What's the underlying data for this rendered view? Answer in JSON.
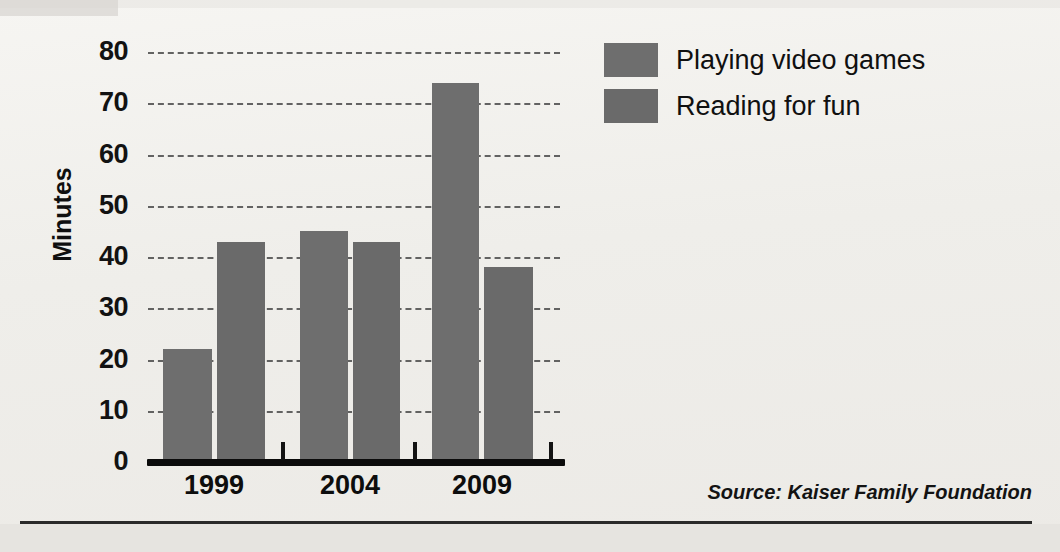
{
  "chart_data": {
    "type": "bar",
    "title": "",
    "subtitle": "",
    "xlabel": "",
    "ylabel": "Minutes",
    "categories": [
      "1999",
      "2004",
      "2009"
    ],
    "series": [
      {
        "name": "Playing video games",
        "values": [
          22,
          45,
          74
        ],
        "color": "#6e6e6e"
      },
      {
        "name": "Reading for fun",
        "values": [
          43,
          43,
          38
        ],
        "color": "#6a6a6a"
      }
    ],
    "ylim": [
      0,
      80
    ],
    "ytick_labels": [
      "0",
      "10",
      "20",
      "30",
      "40",
      "50",
      "60",
      "70",
      "80"
    ],
    "ytick_values": [
      0,
      10,
      20,
      30,
      40,
      50,
      60,
      70,
      80
    ],
    "grid": "horizontal-dashed",
    "legend_position": "top-right",
    "annotations": [
      "Source: Kaiser Family Foundation"
    ]
  },
  "axis": {
    "y_title": "Minutes",
    "ticks": [
      {
        "label": "80",
        "value": 80
      },
      {
        "label": "70",
        "value": 70
      },
      {
        "label": "60",
        "value": 60
      },
      {
        "label": "50",
        "value": 50
      },
      {
        "label": "40",
        "value": 40
      },
      {
        "label": "30",
        "value": 30
      },
      {
        "label": "20",
        "value": 20
      },
      {
        "label": "10",
        "value": 10
      },
      {
        "label": "0",
        "value": 0
      }
    ],
    "x_labels": [
      "1999",
      "2004",
      "2009"
    ]
  },
  "legend": {
    "items": [
      {
        "label": "Playing video games",
        "color": "#6e6e6e"
      },
      {
        "label": "Reading for fun",
        "color": "#6a6a6a"
      }
    ]
  },
  "footer": {
    "source": "Source: Kaiser Family Foundation"
  },
  "bars": [
    {
      "group": "1999",
      "series": "Playing video games",
      "value": 22,
      "left": 163,
      "width": 49
    },
    {
      "group": "1999",
      "series": "Reading for fun",
      "value": 43,
      "left": 217,
      "width": 48
    },
    {
      "group": "2004",
      "series": "Playing video games",
      "value": 45,
      "left": 300,
      "width": 48
    },
    {
      "group": "2004",
      "series": "Reading for fun",
      "value": 43,
      "left": 353,
      "width": 47
    },
    {
      "group": "2009",
      "series": "Playing video games",
      "value": 74,
      "left": 432,
      "width": 47
    },
    {
      "group": "2009",
      "series": "Reading for fun",
      "value": 38,
      "left": 484,
      "width": 49
    }
  ],
  "colors": {
    "bar": "#6e6e6e",
    "axis": "#0b0b0b",
    "text": "#101010",
    "background": "#f1efec"
  }
}
